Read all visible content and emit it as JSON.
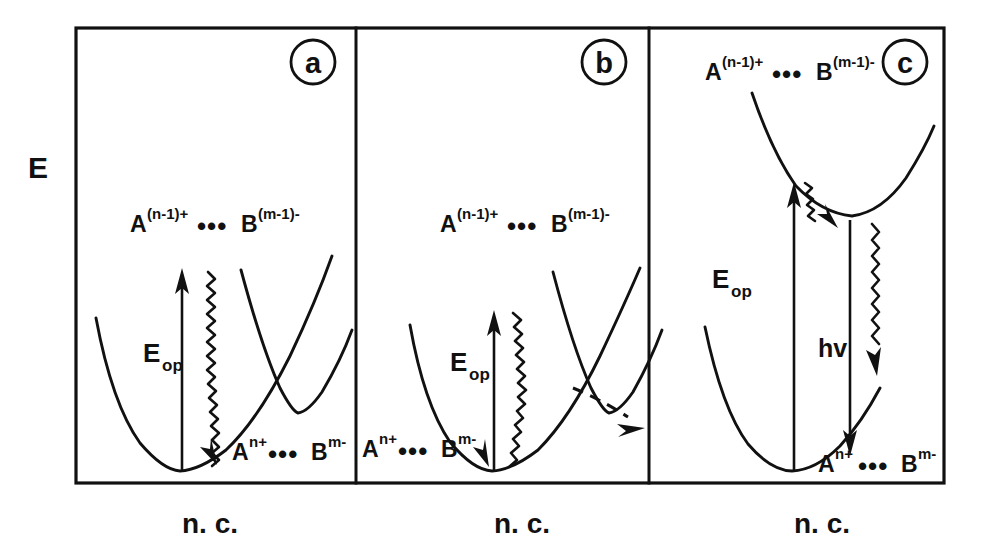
{
  "figure": {
    "axis_label_y": "E",
    "axis_label_x": "n. c.",
    "background_color": "#ffffff",
    "ink_color": "#111111",
    "caption_note": "Potential energy surfaces for optical electron transfer"
  },
  "panels": [
    {
      "id": "a",
      "badge": "a",
      "excited_state_label": {
        "species_a": "A",
        "charge_a": "(n-1)+",
        "bridge": "•••",
        "species_b": "B",
        "charge_b": "(m-1)-"
      },
      "ground_state_label": {
        "species_a": "A",
        "charge_a": "n+",
        "bridge": "•••",
        "species_b": "B",
        "charge_b": "m-"
      },
      "transition_label": {
        "symbol": "E",
        "subscript": "op"
      },
      "axis_label_x": "n. c.",
      "features": [
        "ground-state-parabola",
        "excited-state-parabola",
        "crossing-point",
        "vertical-excitation-arrow",
        "wavy-relaxation-to-ground-minimum"
      ]
    },
    {
      "id": "b",
      "badge": "b",
      "excited_state_label": {
        "species_a": "A",
        "charge_a": "(n-1)+",
        "bridge": "•••",
        "species_b": "B",
        "charge_b": "(m-1)-"
      },
      "ground_state_label": {
        "species_a": "A",
        "charge_a": "n+",
        "bridge": "•••",
        "species_b": "B",
        "charge_b": "m-"
      },
      "transition_label": {
        "symbol": "E",
        "subscript": "op"
      },
      "axis_label_x": "n. c.",
      "features": [
        "ground-state-parabola",
        "excited-state-parabola",
        "crossing-point",
        "vertical-excitation-arrow",
        "wavy-relaxation-to-ground-minimum",
        "dashed-escape-arrow"
      ]
    },
    {
      "id": "c",
      "badge": "c",
      "excited_state_label": {
        "species_a": "A",
        "charge_a": "(n-1)+",
        "bridge": "•••",
        "species_b": "B",
        "charge_b": "(m-1)-"
      },
      "ground_state_label": {
        "species_a": "A",
        "charge_a": "n+",
        "bridge": "•••",
        "species_b": "B",
        "charge_b": "m-"
      },
      "transition_label": {
        "symbol": "E",
        "subscript": "op"
      },
      "emission_label": "hv",
      "axis_label_x": "n. c.",
      "features": [
        "ground-state-parabola",
        "excited-state-well-non-crossing",
        "vertical-excitation-arrow",
        "short-wavy-relaxation-into-excited-well",
        "radiative-emission-arrow",
        "wavy-nonradiative-arrow"
      ]
    }
  ]
}
